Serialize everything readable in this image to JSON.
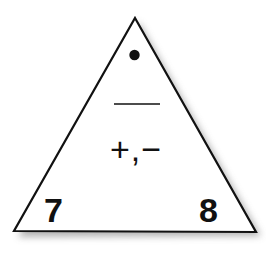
{
  "fact_triangle": {
    "top_value": "•",
    "top_value_meaning": "unknown (missing number)",
    "divider": "——",
    "operations": "+,−",
    "bottom_left_value": "7",
    "bottom_right_value": "8",
    "colors": {
      "outline": "#111111",
      "fill": "#ffffff",
      "shadow": "#9a9a9a",
      "text": "#111111"
    }
  }
}
